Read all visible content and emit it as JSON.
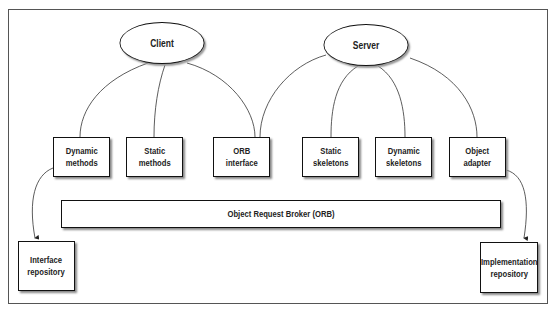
{
  "diagram": {
    "nodes": {
      "client": {
        "label": "Client"
      },
      "server": {
        "label": "Server"
      },
      "dynamic_methods": {
        "line1": "Dynamic",
        "line2": "methods"
      },
      "static_methods": {
        "line1": "Static",
        "line2": "methods"
      },
      "orb_interface": {
        "line1": "ORB",
        "line2": "interface"
      },
      "static_skeletons": {
        "line1": "Static",
        "line2": "skeletons"
      },
      "dynamic_skeletons": {
        "line1": "Dynamic",
        "line2": "skeletons"
      },
      "object_adapter": {
        "line1": "Object",
        "line2": "adapter"
      },
      "orb": {
        "label": "Object Request Broker (ORB)"
      },
      "interface_repository": {
        "line1": "Interface",
        "line2": "repository"
      },
      "implementation_repository": {
        "line1": "Implementation",
        "line2": "repository"
      }
    },
    "edges": [
      {
        "from": "client",
        "to": "dynamic_methods"
      },
      {
        "from": "client",
        "to": "static_methods"
      },
      {
        "from": "client",
        "to": "orb_interface"
      },
      {
        "from": "server",
        "to": "orb_interface"
      },
      {
        "from": "server",
        "to": "static_skeletons"
      },
      {
        "from": "server",
        "to": "dynamic_skeletons"
      },
      {
        "from": "server",
        "to": "object_adapter"
      },
      {
        "from": "dynamic_methods",
        "to": "interface_repository",
        "arrow": true
      },
      {
        "from": "object_adapter",
        "to": "implementation_repository",
        "arrow": true
      }
    ]
  }
}
